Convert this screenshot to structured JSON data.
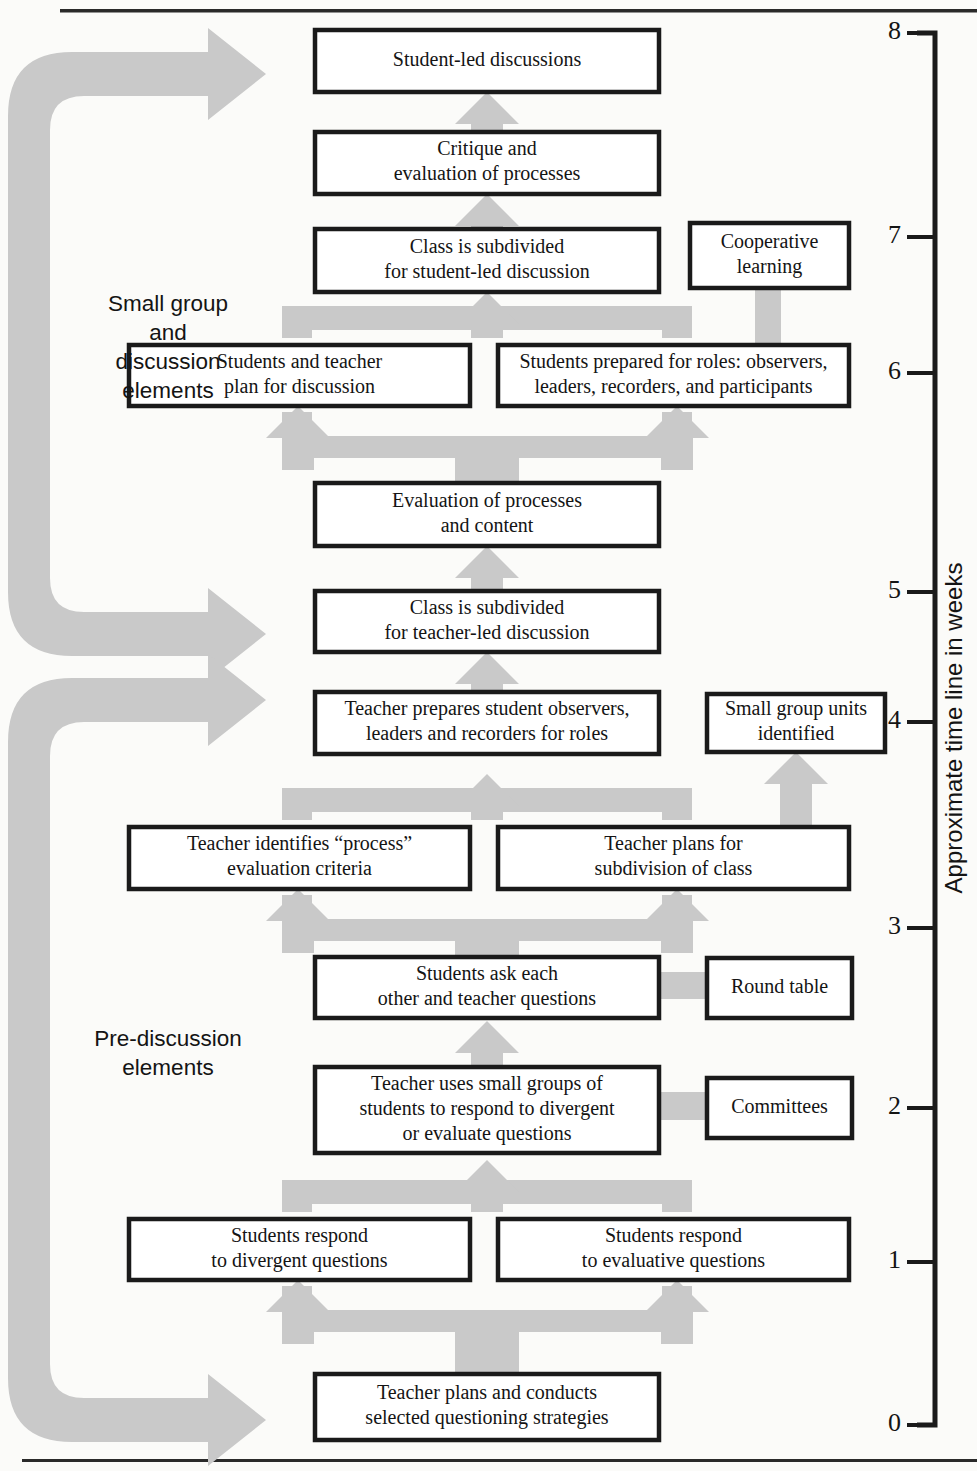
{
  "figure": {
    "type": "flowchart",
    "title_rule_top": true,
    "title_rule_bottom": true,
    "accent_gray": "#c9c9c9",
    "box_stroke": "#1a1a1a",
    "paper": "#fbfbf9"
  },
  "axis": {
    "title": "Approximate time line in weeks",
    "ticks": [
      {
        "label": "8",
        "y": 33
      },
      {
        "label": "7",
        "y": 237
      },
      {
        "label": "6",
        "y": 373
      },
      {
        "label": "5",
        "y": 592
      },
      {
        "label": "4",
        "y": 722
      },
      {
        "label": "3",
        "y": 928
      },
      {
        "label": "2",
        "y": 1108
      },
      {
        "label": "1",
        "y": 1262
      },
      {
        "label": "0",
        "y": 1425
      }
    ],
    "min": 0,
    "max": 8
  },
  "groups": [
    {
      "id": "small-group-and-discussion",
      "lines": [
        "Small group",
        "and",
        "discussion",
        "elements"
      ],
      "label": "Small group and discussion elements",
      "top": 52,
      "bottom": 656
    },
    {
      "id": "pre-discussion",
      "lines": [
        "Pre-discussion",
        "elements"
      ],
      "label": "Pre-discussion elements",
      "top": 678,
      "bottom": 1442
    }
  ],
  "nodes": [
    {
      "id": "student-led-discussions",
      "lines": [
        "Student-led discussions"
      ],
      "x": 315,
      "y": 30,
      "w": 344,
      "h": 62,
      "kind": "main"
    },
    {
      "id": "critique-and-evaluation-of-processes",
      "lines": [
        "Critique and",
        "evaluation of processes"
      ],
      "x": 315,
      "y": 132,
      "w": 344,
      "h": 62,
      "kind": "main"
    },
    {
      "id": "class-subdivided-student-led",
      "lines": [
        "Class is subdivided",
        "for student-led discussion"
      ],
      "x": 315,
      "y": 229,
      "w": 344,
      "h": 63,
      "kind": "main"
    },
    {
      "id": "cooperative-learning",
      "lines": [
        "Cooperative",
        "learning"
      ],
      "x": 690,
      "y": 223,
      "w": 159,
      "h": 65,
      "kind": "side"
    },
    {
      "id": "students-and-teacher-plan",
      "lines": [
        "Students and teacher",
        "plan for discussion"
      ],
      "x": 129,
      "y": 345,
      "w": 341,
      "h": 61,
      "kind": "main"
    },
    {
      "id": "students-prepared-for-roles",
      "lines": [
        "Students prepared for roles: observers,",
        "leaders, recorders, and participants"
      ],
      "x": 498,
      "y": 345,
      "w": 351,
      "h": 61,
      "kind": "main"
    },
    {
      "id": "evaluation-of-processes-and-content",
      "lines": [
        "Evaluation of processes",
        "and content"
      ],
      "x": 315,
      "y": 483,
      "w": 344,
      "h": 63,
      "kind": "main"
    },
    {
      "id": "class-subdivided-teacher-led",
      "lines": [
        "Class is subdivided",
        "for teacher-led discussion"
      ],
      "x": 315,
      "y": 591,
      "w": 344,
      "h": 61,
      "kind": "main"
    },
    {
      "id": "teacher-prepares-student-observers",
      "lines": [
        "Teacher prepares student observers,",
        "leaders and recorders for roles"
      ],
      "x": 315,
      "y": 692,
      "w": 344,
      "h": 62,
      "kind": "main"
    },
    {
      "id": "small-group-units-identified",
      "lines": [
        "Small group units",
        "identified"
      ],
      "x": 707,
      "y": 694,
      "w": 178,
      "h": 58,
      "kind": "side"
    },
    {
      "id": "teacher-identifies-process-criteria",
      "lines": [
        "Teacher identifies “process”",
        "evaluation criteria"
      ],
      "x": 129,
      "y": 827,
      "w": 341,
      "h": 62,
      "kind": "main"
    },
    {
      "id": "teacher-plans-subdivision",
      "lines": [
        "Teacher plans for",
        "subdivision of class"
      ],
      "x": 498,
      "y": 827,
      "w": 351,
      "h": 62,
      "kind": "main"
    },
    {
      "id": "students-ask-each-other",
      "lines": [
        "Students ask each",
        "other and teacher questions"
      ],
      "x": 315,
      "y": 957,
      "w": 344,
      "h": 61,
      "kind": "main"
    },
    {
      "id": "round-table",
      "lines": [
        "Round table"
      ],
      "x": 707,
      "y": 958,
      "w": 145,
      "h": 60,
      "kind": "side"
    },
    {
      "id": "teacher-uses-small-groups",
      "lines": [
        "Teacher uses small groups of",
        "students to respond to divergent",
        "or evaluate questions"
      ],
      "x": 315,
      "y": 1067,
      "w": 344,
      "h": 86,
      "kind": "main"
    },
    {
      "id": "committees",
      "lines": [
        "Committees"
      ],
      "x": 707,
      "y": 1078,
      "w": 145,
      "h": 60,
      "kind": "side"
    },
    {
      "id": "students-respond-divergent",
      "lines": [
        "Students respond",
        "to divergent questions"
      ],
      "x": 129,
      "y": 1219,
      "w": 341,
      "h": 61,
      "kind": "main"
    },
    {
      "id": "students-respond-evaluative",
      "lines": [
        "Students respond",
        "to evaluative questions"
      ],
      "x": 498,
      "y": 1219,
      "w": 351,
      "h": 61,
      "kind": "main"
    },
    {
      "id": "teacher-plans-and-conducts",
      "lines": [
        "Teacher plans and conducts",
        "selected questioning strategies"
      ],
      "x": 315,
      "y": 1374,
      "w": 344,
      "h": 66,
      "kind": "main"
    }
  ],
  "connections": [
    {
      "from": "critique-and-evaluation-of-processes",
      "to": "student-led-discussions",
      "kind": "arrow-up"
    },
    {
      "from": "class-subdivided-student-led",
      "to": "critique-and-evaluation-of-processes",
      "kind": "arrow-up"
    },
    {
      "from": "cooperative-learning",
      "to": "students-prepared-for-roles",
      "kind": "bar-down"
    },
    {
      "from": "students-and-teacher-plan",
      "to": "class-subdivided-student-led",
      "kind": "merge-up"
    },
    {
      "from": "students-prepared-for-roles",
      "to": "class-subdivided-student-led",
      "kind": "merge-up"
    },
    {
      "from": "evaluation-of-processes-and-content",
      "to": "students-and-teacher-plan",
      "kind": "split-up"
    },
    {
      "from": "evaluation-of-processes-and-content",
      "to": "students-prepared-for-roles",
      "kind": "split-up"
    },
    {
      "from": "class-subdivided-teacher-led",
      "to": "evaluation-of-processes-and-content",
      "kind": "arrow-up"
    },
    {
      "from": "teacher-prepares-student-observers",
      "to": "class-subdivided-teacher-led",
      "kind": "arrow-up"
    },
    {
      "from": "teacher-identifies-process-criteria",
      "to": "teacher-prepares-student-observers",
      "kind": "merge-up"
    },
    {
      "from": "teacher-plans-subdivision",
      "to": "teacher-prepares-student-observers",
      "kind": "merge-up"
    },
    {
      "from": "teacher-plans-subdivision",
      "to": "small-group-units-identified",
      "kind": "arrow-up"
    },
    {
      "from": "students-ask-each-other",
      "to": "teacher-identifies-process-criteria",
      "kind": "split-up"
    },
    {
      "from": "students-ask-each-other",
      "to": "teacher-plans-subdivision",
      "kind": "split-up"
    },
    {
      "from": "students-ask-each-other",
      "to": "round-table",
      "kind": "bar-right"
    },
    {
      "from": "teacher-uses-small-groups",
      "to": "students-ask-each-other",
      "kind": "arrow-up"
    },
    {
      "from": "teacher-uses-small-groups",
      "to": "committees",
      "kind": "bar-right"
    },
    {
      "from": "students-respond-divergent",
      "to": "teacher-uses-small-groups",
      "kind": "merge-up"
    },
    {
      "from": "students-respond-evaluative",
      "to": "teacher-uses-small-groups",
      "kind": "merge-up"
    },
    {
      "from": "teacher-plans-and-conducts",
      "to": "students-respond-divergent",
      "kind": "split-up"
    },
    {
      "from": "teacher-plans-and-conducts",
      "to": "students-respond-evaluative",
      "kind": "split-up"
    }
  ]
}
